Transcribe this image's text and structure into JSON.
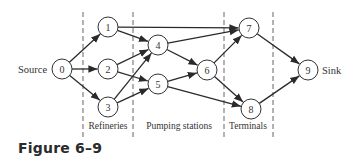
{
  "figure": {
    "caption": "Figure 6–9",
    "source_label": "Source",
    "sink_label": "Sink",
    "stages": [
      {
        "label": "Refineries",
        "x": 108
      },
      {
        "label": "Pumping stations",
        "x": 179
      },
      {
        "label": "Terminals",
        "x": 248
      }
    ],
    "dividers": [
      83,
      133,
      224,
      273
    ],
    "nodes": [
      {
        "id": "0",
        "label": "0",
        "x": 62,
        "y": 69
      },
      {
        "id": "1",
        "label": "1",
        "x": 108,
        "y": 27
      },
      {
        "id": "2",
        "label": "2",
        "x": 108,
        "y": 69
      },
      {
        "id": "3",
        "label": "3",
        "x": 108,
        "y": 107
      },
      {
        "id": "4",
        "label": "4",
        "x": 158,
        "y": 45
      },
      {
        "id": "5",
        "label": "5",
        "x": 158,
        "y": 84
      },
      {
        "id": "6",
        "label": "6",
        "x": 207,
        "y": 70
      },
      {
        "id": "7",
        "label": "7",
        "x": 249,
        "y": 28
      },
      {
        "id": "8",
        "label": "8",
        "x": 251,
        "y": 109
      },
      {
        "id": "9",
        "label": "9",
        "x": 308,
        "y": 70
      }
    ],
    "edges": [
      [
        "0",
        "1"
      ],
      [
        "0",
        "2"
      ],
      [
        "0",
        "3"
      ],
      [
        "1",
        "4"
      ],
      [
        "1",
        "7"
      ],
      [
        "2",
        "4"
      ],
      [
        "2",
        "5"
      ],
      [
        "3",
        "4"
      ],
      [
        "3",
        "5"
      ],
      [
        "4",
        "6"
      ],
      [
        "4",
        "7"
      ],
      [
        "5",
        "6"
      ],
      [
        "5",
        "8"
      ],
      [
        "6",
        "7"
      ],
      [
        "6",
        "8"
      ],
      [
        "7",
        "9"
      ],
      [
        "8",
        "9"
      ]
    ]
  }
}
